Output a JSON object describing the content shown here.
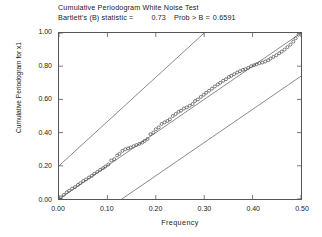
{
  "chart_data": {
    "type": "scatter",
    "title": "Cumulative Periodogram White Noise Test",
    "subtitle_prefix": "Bartlett's (B) statistic =",
    "statistic_value": "0.73",
    "prob_label": "Prob > B =",
    "prob_value": "0.6591",
    "xlabel": "Frequency",
    "ylabel": "Cumulative Periodogram for x1",
    "xlim": [
      0.0,
      0.5
    ],
    "ylim": [
      0.0,
      1.0
    ],
    "xticks": [
      "0.00",
      "0.10",
      "0.20",
      "0.30",
      "0.40",
      "0.50"
    ],
    "xtick_values": [
      0.0,
      0.1,
      0.2,
      0.3,
      0.4,
      0.5
    ],
    "yticks": [
      "0.00",
      "0.20",
      "0.40",
      "0.60",
      "0.80",
      "1.00"
    ],
    "ytick_values": [
      0.0,
      0.2,
      0.4,
      0.6,
      0.8,
      1.0
    ],
    "grid": false,
    "legend": "none",
    "marker": "open-circle",
    "marker_color": "#444444",
    "line_color": "#555555",
    "frame_color": "#555555",
    "reference_lines": [
      {
        "name": "upper-confidence-band",
        "x": [
          0.0,
          0.3
        ],
        "y": [
          0.2,
          1.0
        ]
      },
      {
        "name": "center-diagonal",
        "x": [
          0.0,
          0.5
        ],
        "y": [
          0.0,
          1.0
        ]
      },
      {
        "name": "lower-confidence-band",
        "x": [
          0.13,
          0.5
        ],
        "y": [
          0.0,
          0.74
        ]
      }
    ],
    "x": [
      0.004,
      0.01,
      0.016,
      0.021,
      0.027,
      0.033,
      0.039,
      0.044,
      0.05,
      0.056,
      0.062,
      0.068,
      0.073,
      0.079,
      0.085,
      0.091,
      0.096,
      0.102,
      0.108,
      0.114,
      0.12,
      0.125,
      0.131,
      0.137,
      0.143,
      0.148,
      0.154,
      0.16,
      0.166,
      0.172,
      0.177,
      0.183,
      0.189,
      0.195,
      0.2,
      0.206,
      0.212,
      0.218,
      0.224,
      0.229,
      0.235,
      0.241,
      0.247,
      0.252,
      0.258,
      0.264,
      0.27,
      0.276,
      0.281,
      0.287,
      0.293,
      0.299,
      0.304,
      0.31,
      0.316,
      0.322,
      0.328,
      0.333,
      0.339,
      0.345,
      0.351,
      0.356,
      0.362,
      0.368,
      0.374,
      0.38,
      0.385,
      0.391,
      0.397,
      0.403,
      0.408,
      0.414,
      0.42,
      0.426,
      0.432,
      0.437,
      0.443,
      0.449,
      0.455,
      0.46,
      0.466,
      0.472,
      0.478,
      0.484,
      0.489,
      0.495
    ],
    "y": [
      0.01,
      0.025,
      0.04,
      0.05,
      0.062,
      0.072,
      0.085,
      0.095,
      0.108,
      0.118,
      0.13,
      0.14,
      0.152,
      0.163,
      0.175,
      0.186,
      0.196,
      0.208,
      0.232,
      0.24,
      0.262,
      0.272,
      0.29,
      0.3,
      0.305,
      0.31,
      0.318,
      0.325,
      0.332,
      0.34,
      0.35,
      0.362,
      0.39,
      0.4,
      0.42,
      0.432,
      0.452,
      0.462,
      0.47,
      0.48,
      0.5,
      0.512,
      0.525,
      0.532,
      0.545,
      0.552,
      0.562,
      0.572,
      0.59,
      0.6,
      0.615,
      0.628,
      0.64,
      0.652,
      0.665,
      0.678,
      0.69,
      0.7,
      0.712,
      0.722,
      0.735,
      0.742,
      0.752,
      0.762,
      0.77,
      0.778,
      0.782,
      0.79,
      0.8,
      0.806,
      0.812,
      0.818,
      0.822,
      0.828,
      0.836,
      0.846,
      0.856,
      0.866,
      0.878,
      0.888,
      0.9,
      0.915,
      0.93,
      0.948,
      0.968,
      0.99
    ]
  }
}
